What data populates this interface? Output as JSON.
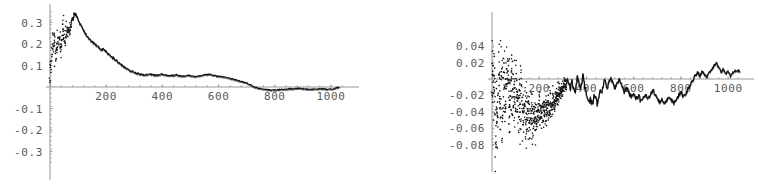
{
  "page": {
    "background": "#ffffff",
    "ink_color": "#111111",
    "axis_color": "#8a8a8a",
    "label_color": "#5a5a5a"
  },
  "chart_data": [
    {
      "id": "left-plot",
      "type": "scatter",
      "title": "",
      "xlabel": "",
      "ylabel": "",
      "xlim": [
        0,
        1050
      ],
      "ylim": [
        -0.35,
        0.36
      ],
      "grid": false,
      "legend": null,
      "xticks": [
        200,
        400,
        600,
        800,
        1000
      ],
      "xtick_labels": [
        "200",
        "400",
        "600",
        "800",
        "1000"
      ],
      "yticks": [
        0.3,
        0.2,
        0.1,
        -0.1,
        -0.2,
        -0.3
      ],
      "ytick_labels": [
        "0.3",
        "0.2",
        "0.1",
        "-0.1",
        "-0.2",
        "-0.3"
      ],
      "axis_origin": [
        0,
        0
      ],
      "description": "Noisy scatter near the origin rising to a peak of about 0.34 near x=80, then a monotone decay that thickens into a dense band, crossing zero near x=720 and staying slightly negative out to x=1000.",
      "series": [
        {
          "name": "left-envelope",
          "style": "dense-dotted-curve",
          "x": [
            2,
            6,
            10,
            14,
            18,
            22,
            26,
            30,
            34,
            38,
            42,
            46,
            50,
            54,
            58,
            62,
            66,
            70,
            74,
            78,
            82,
            86,
            90,
            94,
            98,
            102,
            106,
            110,
            114,
            118,
            124,
            130,
            136,
            142,
            148,
            154,
            160,
            166,
            172,
            178,
            184,
            190,
            196,
            202,
            208,
            214,
            220,
            226,
            232,
            238,
            244,
            250,
            258,
            266,
            274,
            282,
            290,
            298,
            306,
            314,
            322,
            330,
            338,
            346,
            354,
            362,
            370,
            378,
            386,
            394,
            402,
            410,
            418,
            426,
            434,
            442,
            450,
            458,
            466,
            474,
            482,
            490,
            498,
            506,
            514,
            522,
            530,
            538,
            546,
            554,
            562,
            570,
            578,
            586,
            594,
            602,
            610,
            618,
            626,
            634,
            642,
            650,
            660,
            670,
            680,
            690,
            700,
            710,
            720,
            730,
            740,
            750,
            760,
            770,
            780,
            790,
            800,
            810,
            820,
            830,
            840,
            850,
            860,
            870,
            880,
            890,
            900,
            910,
            920,
            930,
            940,
            950,
            960,
            970,
            980,
            990,
            1000,
            1010,
            1020,
            1030,
            1040
          ],
          "y": [
            0.075,
            0.12,
            0.185,
            0.232,
            0.205,
            0.168,
            0.21,
            0.245,
            0.228,
            0.196,
            0.236,
            0.262,
            0.248,
            0.222,
            0.258,
            0.28,
            0.268,
            0.246,
            0.282,
            0.305,
            0.318,
            0.332,
            0.34,
            0.334,
            0.322,
            0.308,
            0.296,
            0.29,
            0.278,
            0.268,
            0.252,
            0.24,
            0.232,
            0.222,
            0.212,
            0.206,
            0.2,
            0.194,
            0.186,
            0.178,
            0.172,
            0.178,
            0.17,
            0.16,
            0.152,
            0.146,
            0.14,
            0.134,
            0.128,
            0.122,
            0.116,
            0.11,
            0.1,
            0.092,
            0.086,
            0.08,
            0.074,
            0.07,
            0.066,
            0.062,
            0.06,
            0.058,
            0.057,
            0.058,
            0.06,
            0.059,
            0.056,
            0.054,
            0.055,
            0.058,
            0.06,
            0.058,
            0.054,
            0.052,
            0.053,
            0.055,
            0.056,
            0.054,
            0.052,
            0.05,
            0.052,
            0.054,
            0.053,
            0.05,
            0.048,
            0.05,
            0.052,
            0.054,
            0.056,
            0.058,
            0.059,
            0.058,
            0.056,
            0.054,
            0.052,
            0.05,
            0.048,
            0.046,
            0.044,
            0.042,
            0.04,
            0.038,
            0.034,
            0.03,
            0.026,
            0.022,
            0.018,
            0.012,
            0.006,
            0.0,
            -0.004,
            -0.008,
            -0.01,
            -0.012,
            -0.013,
            -0.014,
            -0.014,
            -0.013,
            -0.012,
            -0.011,
            -0.01,
            -0.009,
            -0.008,
            -0.008,
            -0.007,
            -0.006,
            -0.007,
            -0.008,
            -0.009,
            -0.01,
            -0.01,
            -0.009,
            -0.008,
            -0.008,
            -0.009,
            -0.01,
            -0.01,
            -0.009,
            -0.002
          ]
        }
      ]
    },
    {
      "id": "right-plot",
      "type": "scatter",
      "title": "",
      "xlabel": "",
      "ylabel": "",
      "xlim": [
        0,
        1050
      ],
      "ylim": [
        -0.085,
        0.045
      ],
      "grid": false,
      "legend": null,
      "xticks": [
        200,
        400,
        600,
        800,
        1000
      ],
      "xtick_labels": [
        "200",
        "400",
        "600",
        "800",
        "1000"
      ],
      "yticks": [
        0.04,
        0.02,
        -0.02,
        -0.04,
        -0.06,
        -0.08
      ],
      "ytick_labels": [
        "0.04",
        "0.02",
        "-0.02",
        "-0.04",
        "-0.06",
        "-0.08"
      ],
      "axis_origin": [
        0,
        0
      ],
      "description": "Broad vertical scatter at the left edge spanning -0.08 to +0.045 that contracts with increasing x; a trough near -0.045 around x=150, oscillation between -0.03 and 0 through the middle, then a rise above zero to about +0.02 after x=800.",
      "series": [
        {
          "name": "right-envelope",
          "style": "dense-dotted-curve",
          "x": [
            2,
            6,
            10,
            14,
            18,
            22,
            26,
            30,
            34,
            38,
            42,
            46,
            50,
            56,
            62,
            68,
            74,
            80,
            86,
            92,
            98,
            104,
            110,
            116,
            122,
            128,
            134,
            140,
            146,
            152,
            158,
            164,
            170,
            176,
            182,
            188,
            194,
            200,
            206,
            212,
            218,
            224,
            230,
            236,
            242,
            248,
            254,
            260,
            266,
            272,
            278,
            284,
            290,
            296,
            302,
            308,
            314,
            320,
            326,
            332,
            338,
            344,
            350,
            356,
            362,
            368,
            374,
            380,
            386,
            392,
            398,
            404,
            410,
            416,
            422,
            428,
            434,
            440,
            446,
            452,
            458,
            464,
            470,
            476,
            482,
            488,
            494,
            500,
            510,
            520,
            530,
            540,
            550,
            560,
            570,
            580,
            590,
            600,
            610,
            620,
            630,
            640,
            650,
            660,
            670,
            680,
            690,
            700,
            710,
            720,
            730,
            740,
            750,
            760,
            770,
            780,
            790,
            800,
            810,
            820,
            830,
            840,
            850,
            860,
            870,
            880,
            890,
            900,
            910,
            920,
            930,
            940,
            950,
            960,
            970,
            980,
            990,
            1000,
            1010,
            1020,
            1030,
            1040
          ],
          "y": [
            0.0,
            -0.03,
            0.038,
            -0.06,
            0.012,
            -0.075,
            -0.01,
            0.02,
            -0.048,
            -0.018,
            0.004,
            -0.055,
            0.018,
            -0.035,
            -0.008,
            0.022,
            -0.062,
            -0.014,
            0.0,
            -0.04,
            -0.026,
            -0.006,
            -0.05,
            -0.034,
            -0.044,
            -0.02,
            -0.056,
            -0.038,
            -0.046,
            -0.042,
            -0.05,
            -0.036,
            -0.048,
            -0.044,
            -0.052,
            -0.04,
            -0.046,
            -0.042,
            -0.038,
            -0.044,
            -0.03,
            -0.036,
            -0.042,
            -0.028,
            -0.034,
            -0.022,
            -0.03,
            -0.026,
            -0.032,
            -0.018,
            -0.024,
            -0.012,
            -0.02,
            -0.008,
            -0.016,
            -0.004,
            -0.012,
            0.002,
            -0.006,
            -0.014,
            -0.002,
            -0.01,
            -0.018,
            -0.008,
            0.004,
            -0.006,
            -0.014,
            -0.004,
            0.006,
            -0.008,
            -0.016,
            -0.024,
            -0.028,
            -0.022,
            -0.03,
            -0.026,
            -0.018,
            -0.024,
            -0.03,
            -0.02,
            -0.012,
            -0.018,
            -0.008,
            0.0,
            -0.006,
            -0.012,
            -0.004,
            0.002,
            -0.004,
            -0.01,
            -0.006,
            0.0,
            -0.008,
            -0.014,
            -0.01,
            -0.016,
            -0.022,
            -0.018,
            -0.024,
            -0.02,
            -0.026,
            -0.022,
            -0.018,
            -0.024,
            -0.02,
            -0.014,
            -0.018,
            -0.024,
            -0.028,
            -0.024,
            -0.03,
            -0.026,
            -0.022,
            -0.026,
            -0.03,
            -0.026,
            -0.02,
            -0.016,
            -0.022,
            -0.018,
            -0.012,
            -0.006,
            -0.002,
            0.004,
            0.008,
            0.004,
            0.01,
            0.006,
            0.002,
            0.008,
            0.012,
            0.016,
            0.02,
            0.014,
            0.008,
            0.012,
            0.006,
            0.01,
            0.004,
            0.008,
            0.01
          ]
        }
      ]
    }
  ]
}
